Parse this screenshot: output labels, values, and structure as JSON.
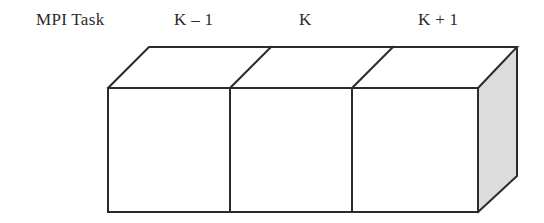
{
  "figure": {
    "title": "",
    "labels": {
      "row_label": "MPI Task",
      "task_prev": "K – 1",
      "task_current": "K",
      "task_next": "K + 1"
    },
    "diagram": {
      "type": "3d-block-row",
      "cell_count": 3,
      "stroke_color": "#2b2b2b",
      "front_face_color": "#ffffff",
      "top_face_color": "#ffffff",
      "side_face_color": "#dcdcdc",
      "stroke_width": 2
    }
  }
}
